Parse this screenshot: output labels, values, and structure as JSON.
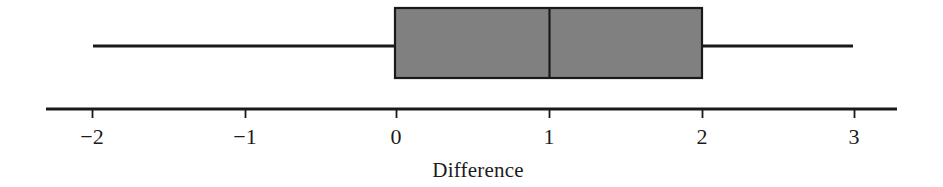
{
  "chart_data": {
    "type": "box",
    "title": "",
    "subtitle": "",
    "orientation": "horizontal",
    "xlabel": "Difference",
    "ylabel": "",
    "xlim": [
      -2.3,
      3.3
    ],
    "xticks": [
      -2,
      -1,
      0,
      1,
      2,
      3
    ],
    "xticklabels": [
      "−2",
      "−1",
      "0",
      "1",
      "2",
      "3"
    ],
    "grid": false,
    "legend": null,
    "series": [
      {
        "name": "Difference",
        "whisker_low": -2.0,
        "q1": 0.0,
        "median": 1.0,
        "q3": 2.0,
        "whisker_high": 3.0,
        "outliers": []
      }
    ],
    "box_fill_color": "#808080",
    "box_edge_color": "#1a1a1a",
    "line_color": "#1a1a1a",
    "background_color": "#ffffff"
  },
  "axis": {
    "label": "Difference",
    "ticks": [
      {
        "value": -2,
        "label": "−2",
        "x": 92
      },
      {
        "value": -1,
        "label": "−1",
        "x": 245
      },
      {
        "value": 0,
        "label": "0",
        "x": 396
      },
      {
        "value": 1,
        "label": "1",
        "x": 549
      },
      {
        "value": 2,
        "label": "2",
        "x": 702
      },
      {
        "value": 3,
        "label": "3",
        "x": 854
      }
    ],
    "line_start_x": 46,
    "line_end_x": 897,
    "line_y": 109,
    "tick_length": 9
  },
  "box": {
    "left_x": 395,
    "right_x": 702,
    "median_x": 549,
    "top_y": 8,
    "bottom_y": 78,
    "whisker_y": 46,
    "whisker_left_x": 93,
    "whisker_right_x": 853
  }
}
